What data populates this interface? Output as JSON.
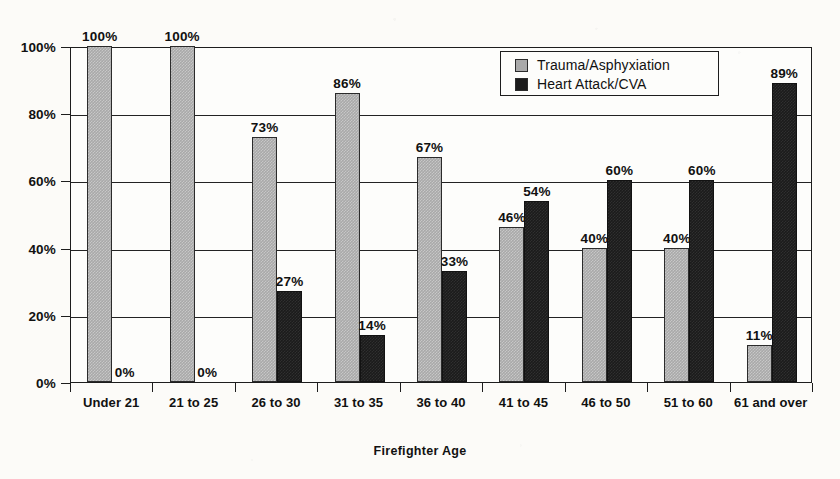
{
  "chart_data": {
    "type": "bar",
    "title": "",
    "xlabel": "Firefighter Age",
    "ylabel": "",
    "categories": [
      "Under 21",
      "21 to 25",
      "26 to 30",
      "31 to 35",
      "36 to 40",
      "41 to 45",
      "46 to 50",
      "51 to 60",
      "61 and over"
    ],
    "series": [
      {
        "name": "Trauma/Asphyxiation",
        "color": "#a9a9a9",
        "values": [
          100,
          100,
          73,
          86,
          67,
          46,
          40,
          40,
          11
        ],
        "labels": [
          "100%",
          "100%",
          "73%",
          "86%",
          "67%",
          "46%",
          "40%",
          "40%",
          "11%"
        ]
      },
      {
        "name": "Heart Attack/CVA",
        "color": "#1b1b1b",
        "values": [
          0,
          0,
          27,
          14,
          33,
          54,
          60,
          60,
          89
        ],
        "labels": [
          "0%",
          "0%",
          "27%",
          "14%",
          "33%",
          "54%",
          "60%",
          "60%",
          "89%"
        ]
      }
    ],
    "ylim": [
      0,
      100
    ],
    "yticks": [
      0,
      20,
      40,
      60,
      80,
      100
    ],
    "ytick_labels": [
      "0%",
      "20%",
      "40%",
      "60%",
      "80%",
      "100%"
    ],
    "grid": true,
    "legend_position": "top-right",
    "value_labels": true
  },
  "legend": {
    "items": [
      {
        "label": "Trauma/Asphyxiation",
        "swatch": "#a9a9a9"
      },
      {
        "label": "Heart Attack/CVA",
        "swatch": "#1b1b1b"
      }
    ]
  },
  "axis": {
    "x_title": "Firefighter Age"
  }
}
